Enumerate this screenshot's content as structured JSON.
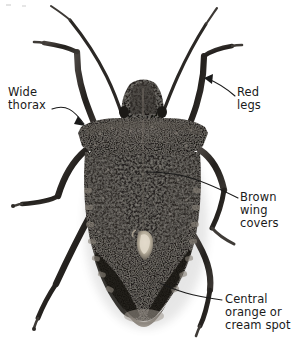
{
  "figure": {
    "background_color": "#ffffff",
    "body_color": "#1d1b19",
    "body_mid_color": "#3a3633",
    "body_highlight_color": "#8d8781",
    "leg_color": "#2e2b28",
    "spot_color": "#cfc7b8",
    "label_color": "#1a1a1a",
    "leader_color": "#1a1a1a"
  },
  "labels": [
    {
      "id": "wide-thorax",
      "lines": [
        "Wide",
        "thorax"
      ],
      "line1": "Wide",
      "line2": "thorax",
      "side": "left",
      "points_to": "pronotum-shoulder"
    },
    {
      "id": "red-legs",
      "lines": [
        "Red",
        "legs"
      ],
      "line1": "Red",
      "line2": "legs",
      "side": "right",
      "points_to": "front-right-leg"
    },
    {
      "id": "brown-wing-covers",
      "lines": [
        "Brown",
        "wing",
        "covers"
      ],
      "line1": "Brown",
      "line2": "wing",
      "line3": "covers",
      "side": "right",
      "points_to": "hemelytra"
    },
    {
      "id": "central-orange-or-cream-spot",
      "lines": [
        "Central",
        "orange or",
        "cream spot"
      ],
      "line1": "Central",
      "line2": "orange or",
      "line3": "cream spot",
      "side": "right",
      "points_to": "scutellum-spot"
    }
  ],
  "anatomy": {
    "head": "head",
    "antennae": "antennae",
    "pronotum": "pronotum",
    "scutellum": "scutellum",
    "hemelytra": "wing-covers",
    "connexivum": "abdomen-margin-bands",
    "legs": "six-legs",
    "central_spot": "central-orange-or-cream-spot"
  }
}
